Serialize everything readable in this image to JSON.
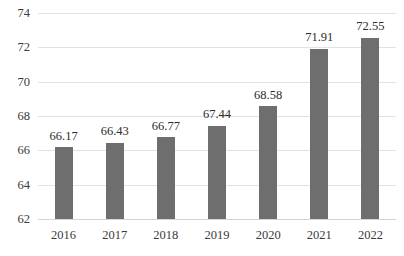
{
  "chart_data": {
    "type": "bar",
    "title": "",
    "subtitle": "",
    "xlabel": "",
    "ylabel": "",
    "categories": [
      "2016",
      "2017",
      "2018",
      "2019",
      "2020",
      "2021",
      "2022"
    ],
    "values": [
      66.17,
      66.43,
      66.77,
      67.44,
      68.58,
      71.91,
      72.55
    ],
    "value_labels": [
      "66.17",
      "66.43",
      "66.77",
      "67.44",
      "68.58",
      "71.91",
      "72.55"
    ],
    "ylim": [
      62,
      74
    ],
    "yticks": [
      62,
      64,
      66,
      68,
      70,
      72,
      74
    ],
    "ytick_labels": [
      "62",
      "64",
      "66",
      "68",
      "70",
      "72",
      "74"
    ],
    "grid": true,
    "grid_axis": "y",
    "legend": false,
    "legend_position": "none",
    "series": [
      {
        "name": "",
        "values": [
          66.17,
          66.43,
          66.77,
          67.44,
          68.58,
          71.91,
          72.55
        ],
        "color": "#6e6e6e"
      }
    ],
    "colors": {
      "bar": "#6e6e6e",
      "grid": "#e2e2e2",
      "axis": "#d4d4d4",
      "text": "#3a3a3a",
      "background": "#ffffff"
    }
  }
}
